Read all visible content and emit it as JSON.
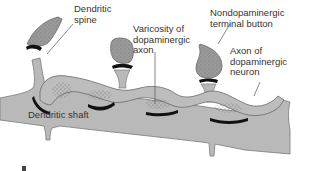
{
  "diagram": {
    "labels": {
      "dendritic_spine": [
        "Dendritic",
        "spine"
      ],
      "varicosity": [
        "Varicosity of",
        "dopaminergic",
        "axon"
      ],
      "nondopaminergic": [
        "Nondopaminergic",
        "terminal button"
      ],
      "axon": [
        "Axon of",
        "dopaminergic",
        "neuron"
      ],
      "dendritic_shaft": "Dendritic shaft"
    },
    "colors": {
      "shaft_fill": "#b9b9b9",
      "terminal_fill": "#9a9a9a",
      "axon_fill": "#bdbdbd",
      "synapse": "#111111",
      "outline": "#6a6a6a",
      "text": "#333333"
    }
  }
}
